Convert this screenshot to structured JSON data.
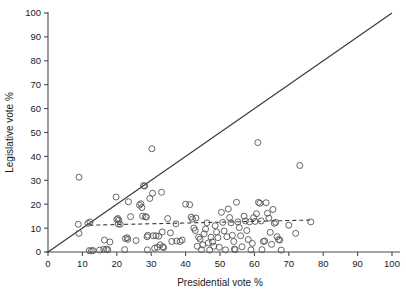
{
  "figure": {
    "background": "#ffffff",
    "point_color": "#555555",
    "line_color": "#3a3a3a",
    "axis_color": "#4a4a4a"
  },
  "chart_data": {
    "type": "scatter",
    "title": "",
    "xlabel": "Presidential vote %",
    "ylabel": "Legislative vote %",
    "xlim": [
      0,
      100
    ],
    "ylim": [
      0,
      100
    ],
    "xticks": [
      0,
      10,
      20,
      30,
      40,
      50,
      60,
      70,
      80,
      90,
      100
    ],
    "yticks": [
      0,
      10,
      20,
      30,
      40,
      50,
      60,
      70,
      80,
      90,
      100
    ],
    "xtick_labels": [
      "0",
      "10",
      "20",
      "30",
      "40",
      "50",
      "60",
      "70",
      "80",
      "90",
      "100"
    ],
    "ytick_labels": [
      "0",
      "10",
      "20",
      "30",
      "40",
      "50",
      "60",
      "70",
      "80",
      "90",
      "100"
    ],
    "grid": false,
    "legend": null,
    "marker": "open-circle",
    "marker_size": 3.0,
    "reference_line": {
      "label": "y = x diagonal",
      "style": "solid",
      "x": [
        0,
        100
      ],
      "y": [
        0,
        100
      ]
    },
    "fit_line": {
      "label": "regression fit",
      "style": "dashed",
      "x": [
        12,
        77
      ],
      "y": [
        11.2,
        13.4
      ]
    },
    "points": [
      [
        9.0,
        31.3
      ],
      [
        8.8,
        11.6
      ],
      [
        9.0,
        7.8
      ],
      [
        11.6,
        12.0
      ],
      [
        12.2,
        12.6
      ],
      [
        12.0,
        0.6
      ],
      [
        12.6,
        0.5
      ],
      [
        13.1,
        0.6
      ],
      [
        15.0,
        0.8
      ],
      [
        16.2,
        1.1
      ],
      [
        16.4,
        5.0
      ],
      [
        17.0,
        1.2
      ],
      [
        17.4,
        0.9
      ],
      [
        18.0,
        4.2
      ],
      [
        19.8,
        23.0
      ],
      [
        20.0,
        13.6
      ],
      [
        20.3,
        14.0
      ],
      [
        20.6,
        13.3
      ],
      [
        20.4,
        11.7
      ],
      [
        21.0,
        11.6
      ],
      [
        22.3,
        1.0
      ],
      [
        22.5,
        5.6
      ],
      [
        23.0,
        6.0
      ],
      [
        23.2,
        5.3
      ],
      [
        23.4,
        21.0
      ],
      [
        24.0,
        14.8
      ],
      [
        25.6,
        4.8
      ],
      [
        26.6,
        19.6
      ],
      [
        27.0,
        20.2
      ],
      [
        27.3,
        18.6
      ],
      [
        27.5,
        15.0
      ],
      [
        27.8,
        27.8
      ],
      [
        28.1,
        27.6
      ],
      [
        28.3,
        14.8
      ],
      [
        28.6,
        14.6
      ],
      [
        28.8,
        6.4
      ],
      [
        29.0,
        7.0
      ],
      [
        28.9,
        0.9
      ],
      [
        29.6,
        22.4
      ],
      [
        30.2,
        43.2
      ],
      [
        30.4,
        24.6
      ],
      [
        30.6,
        6.8
      ],
      [
        31.0,
        1.6
      ],
      [
        31.4,
        6.8
      ],
      [
        31.8,
        2.0
      ],
      [
        32.2,
        6.6
      ],
      [
        32.6,
        3.0
      ],
      [
        33.0,
        25.0
      ],
      [
        33.2,
        8.4
      ],
      [
        33.4,
        2.2
      ],
      [
        33.6,
        1.8
      ],
      [
        34.8,
        14.0
      ],
      [
        35.6,
        8.0
      ],
      [
        36.0,
        4.4
      ],
      [
        37.2,
        11.8
      ],
      [
        37.4,
        4.6
      ],
      [
        38.4,
        4.4
      ],
      [
        39.0,
        5.0
      ],
      [
        40.0,
        20.0
      ],
      [
        41.2,
        19.8
      ],
      [
        41.6,
        14.6
      ],
      [
        42.0,
        13.8
      ],
      [
        42.4,
        10.0
      ],
      [
        42.8,
        9.0
      ],
      [
        43.0,
        14.2
      ],
      [
        43.4,
        2.4
      ],
      [
        43.8,
        6.2
      ],
      [
        44.2,
        5.4
      ],
      [
        44.6,
        1.0
      ],
      [
        45.0,
        3.0
      ],
      [
        45.4,
        7.6
      ],
      [
        45.8,
        9.6
      ],
      [
        46.2,
        12.2
      ],
      [
        46.6,
        3.8
      ],
      [
        47.0,
        0.8
      ],
      [
        47.4,
        6.2
      ],
      [
        47.8,
        4.2
      ],
      [
        48.2,
        2.4
      ],
      [
        48.6,
        11.0
      ],
      [
        49.0,
        8.4
      ],
      [
        49.4,
        6.0
      ],
      [
        49.8,
        2.0
      ],
      [
        50.4,
        16.6
      ],
      [
        50.8,
        12.4
      ],
      [
        51.2,
        8.8
      ],
      [
        51.6,
        0.9
      ],
      [
        52.0,
        6.4
      ],
      [
        52.4,
        18.0
      ],
      [
        52.8,
        14.4
      ],
      [
        53.2,
        12.2
      ],
      [
        53.6,
        7.0
      ],
      [
        54.0,
        4.4
      ],
      [
        54.2,
        1.2
      ],
      [
        54.4,
        1.0
      ],
      [
        54.8,
        20.8
      ],
      [
        55.2,
        12.6
      ],
      [
        55.6,
        10.2
      ],
      [
        56.0,
        6.8
      ],
      [
        56.4,
        2.2
      ],
      [
        57.0,
        15.0
      ],
      [
        57.4,
        13.0
      ],
      [
        57.8,
        9.0
      ],
      [
        58.2,
        5.2
      ],
      [
        58.6,
        12.6
      ],
      [
        59.0,
        0.9
      ],
      [
        59.4,
        3.6
      ],
      [
        59.8,
        14.4
      ],
      [
        60.2,
        12.8
      ],
      [
        60.6,
        16.0
      ],
      [
        61.0,
        45.8
      ],
      [
        61.2,
        20.8
      ],
      [
        61.6,
        20.4
      ],
      [
        62.0,
        13.0
      ],
      [
        62.2,
        1.0
      ],
      [
        62.6,
        4.4
      ],
      [
        63.0,
        4.6
      ],
      [
        63.4,
        20.6
      ],
      [
        63.8,
        16.2
      ],
      [
        64.2,
        14.2
      ],
      [
        64.6,
        8.2
      ],
      [
        65.0,
        3.2
      ],
      [
        65.4,
        17.8
      ],
      [
        65.8,
        12.0
      ],
      [
        66.2,
        12.4
      ],
      [
        66.6,
        6.4
      ],
      [
        67.0,
        5.2
      ],
      [
        67.4,
        5.0
      ],
      [
        67.8,
        0.8
      ],
      [
        70.0,
        11.2
      ],
      [
        72.0,
        7.8
      ],
      [
        73.2,
        36.2
      ],
      [
        76.4,
        12.6
      ]
    ]
  }
}
